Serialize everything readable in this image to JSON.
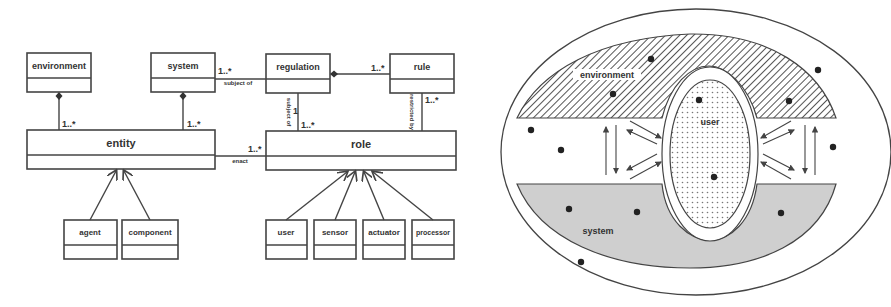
{
  "uml_diagram": {
    "classes": {
      "environment": "environment",
      "system": "system",
      "regulation": "regulation",
      "rule": "rule",
      "entity": "entity",
      "role": "role",
      "agent": "agent",
      "component": "component",
      "user": "user",
      "sensor": "sensor",
      "actuator": "actuator",
      "processor": "processor"
    },
    "multiplicities": {
      "environment_entity": "1..*",
      "system_entity": "1..*",
      "system_regulation": "1..*",
      "regulation_rule": "1..*",
      "regulation_role": "1..*",
      "rule_role": "1..*",
      "entity_role": "1..*",
      "regulation_role_one": "1"
    },
    "association_labels": {
      "system_regulation": "subject of",
      "regulation_role": "subject of",
      "rule_role": "restricted by",
      "entity_role": "enact"
    }
  },
  "venn_diagram": {
    "regions": {
      "environment": "environment",
      "user": "user",
      "system": "system"
    },
    "colors": {
      "outline": "#444444",
      "hatch": "#555555",
      "system_fill": "#cfcfcf",
      "dot": "#222222"
    }
  }
}
